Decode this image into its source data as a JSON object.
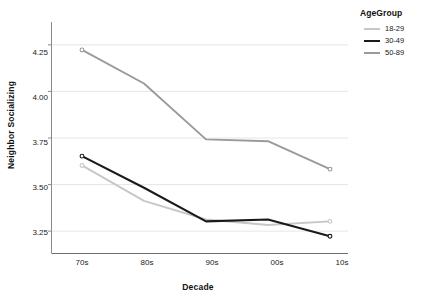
{
  "chart_data": {
    "type": "line",
    "title": "",
    "xlabel": "Decade",
    "ylabel": "Neighbor Socializing",
    "categories": [
      "70s",
      "80s",
      "90s",
      "00s",
      "10s"
    ],
    "ylim": [
      3.13,
      4.37
    ],
    "yticks": [
      "3.25",
      "3.50",
      "3.75",
      "4.00",
      "4.25"
    ],
    "ytick_values": [
      3.25,
      3.5,
      3.75,
      4.0,
      4.25
    ],
    "grid": true,
    "legend_position": "right",
    "legend_title": "AgeGroup",
    "series": [
      {
        "name": "18-29",
        "color": "#c7c7c7",
        "values": [
          3.6,
          3.41,
          3.31,
          3.28,
          3.3
        ]
      },
      {
        "name": "30-49",
        "color": "#1a1a1a",
        "values": [
          3.65,
          3.48,
          3.3,
          3.31,
          3.22
        ]
      },
      {
        "name": "50-89",
        "color": "#9a9a9a",
        "values": [
          4.22,
          4.04,
          3.74,
          3.73,
          3.58
        ]
      }
    ]
  },
  "axes": {
    "x_title": "Decade",
    "y_title": "Neighbor Socializing",
    "x_ticks": [
      "70s",
      "80s",
      "90s",
      "00s",
      "10s"
    ],
    "y_ticks": [
      "3.25",
      "3.50",
      "3.75",
      "4.00",
      "4.25"
    ]
  },
  "legend": {
    "title": "AgeGroup",
    "items": [
      {
        "label": "18-29",
        "color": "#c7c7c7"
      },
      {
        "label": "30-49",
        "color": "#1a1a1a"
      },
      {
        "label": "50-89",
        "color": "#9a9a9a"
      }
    ]
  },
  "colors": {
    "grid": "#e6e6e6",
    "axis": "#8a8a8a",
    "text": "#1a1a1a",
    "background": "#ffffff"
  }
}
